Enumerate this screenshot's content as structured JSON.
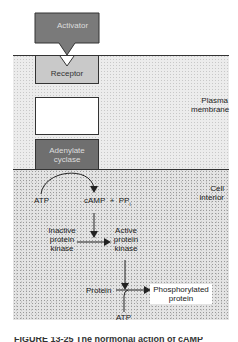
{
  "diagram": {
    "activator": "Activator",
    "receptor": "Receptor",
    "transducer": "",
    "adenylate_cyclase_line1": "Adenylate",
    "adenylate_cyclase_line2": "cyclase",
    "region_membrane_line1": "Plasma",
    "region_membrane_line2": "membrane",
    "region_interior_line1": "Cell",
    "region_interior_line2": "interior",
    "atp": "ATP",
    "camp_ppi": "cAMP  +  PP",
    "camp_ppi_sub": "i",
    "inactive_line1": "Inactive",
    "inactive_line2": "protein",
    "inactive_line3": "kinase",
    "active_line1": "Active",
    "active_line2": "protein",
    "active_line3": "kinase",
    "protein": "Protein",
    "phospho_line1": "Phosphorylated",
    "phospho_line2": "protein",
    "atp2": "ATP",
    "caption": "FIGURE 13-25  The hormonal action of cAMP"
  },
  "colors": {
    "activator": "#7a7a7a",
    "receptor": "#c9c9c9",
    "adenylate_cyclase": "#6f6f6f"
  }
}
